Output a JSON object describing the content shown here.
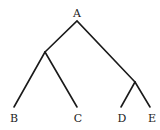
{
  "diagram": {
    "type": "tree",
    "nodes": [
      {
        "id": "A",
        "label": "A",
        "x": 77,
        "y": 13
      },
      {
        "id": "n1",
        "label": "",
        "x": 45,
        "y": 52
      },
      {
        "id": "n2",
        "label": "",
        "x": 135,
        "y": 82
      },
      {
        "id": "B",
        "label": "B",
        "x": 14,
        "y": 118
      },
      {
        "id": "C",
        "label": "C",
        "x": 77,
        "y": 118
      },
      {
        "id": "D",
        "label": "D",
        "x": 122,
        "y": 118
      },
      {
        "id": "E",
        "label": "E",
        "x": 152,
        "y": 118
      }
    ],
    "edges": [
      [
        "A",
        "n1"
      ],
      [
        "A",
        "n2"
      ],
      [
        "n1",
        "B"
      ],
      [
        "n1",
        "C"
      ],
      [
        "n2",
        "D"
      ],
      [
        "n2",
        "E"
      ]
    ]
  }
}
